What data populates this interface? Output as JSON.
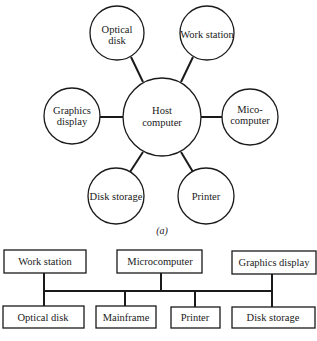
{
  "diagram_a": {
    "caption": "(a)",
    "hub": {
      "line1": "Host",
      "line2": "computer"
    },
    "satellites": [
      {
        "id": "optical-disk",
        "line1": "Optical",
        "line2": "disk"
      },
      {
        "id": "work-station",
        "line1": "Work station",
        "line2": ""
      },
      {
        "id": "graphics-display",
        "line1": "Graphics",
        "line2": "display"
      },
      {
        "id": "mico-computer",
        "line1": "Mico-",
        "line2": "computer"
      },
      {
        "id": "disk-storage",
        "line1": "Disk storage",
        "line2": ""
      },
      {
        "id": "printer",
        "line1": "Printer",
        "line2": ""
      }
    ]
  },
  "diagram_b": {
    "top_nodes": [
      {
        "id": "work-station",
        "label": "Work station"
      },
      {
        "id": "microcomputer",
        "label": "Microcomputer"
      },
      {
        "id": "graphics-display",
        "label": "Graphics display"
      }
    ],
    "bottom_nodes": [
      {
        "id": "optical-disk",
        "label": "Optical disk"
      },
      {
        "id": "mainframe",
        "label": "Mainframe"
      },
      {
        "id": "printer",
        "label": "Printer"
      },
      {
        "id": "disk-storage",
        "label": "Disk storage"
      }
    ]
  }
}
